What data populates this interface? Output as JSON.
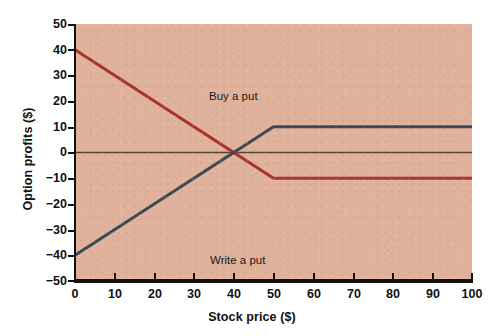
{
  "chart_data": {
    "type": "line",
    "title": "",
    "xlabel": "Stock price ($)",
    "ylabel": "Option profits ($)",
    "xlim": [
      0,
      100
    ],
    "ylim": [
      -50,
      50
    ],
    "xticks": [
      0,
      10,
      20,
      30,
      40,
      50,
      60,
      70,
      80,
      90,
      100
    ],
    "yticks": [
      50,
      40,
      30,
      20,
      10,
      0,
      -10,
      -20,
      -30,
      -40,
      -50
    ],
    "xtick_labels": [
      "0",
      "10",
      "20",
      "30",
      "40",
      "50",
      "60",
      "70",
      "80",
      "90",
      "100"
    ],
    "ytick_labels": [
      "50",
      "40",
      "30",
      "20",
      "10",
      "0",
      "−10",
      "−20",
      "−30",
      "−40",
      "−50"
    ],
    "grid": false,
    "legend": "inline-annotations",
    "zero_line": 0,
    "series": [
      {
        "name": "Buy a put",
        "color": "#a8332a",
        "points": [
          [
            0,
            40
          ],
          [
            50,
            -10
          ],
          [
            100,
            -10
          ]
        ],
        "x": [
          0,
          50,
          100
        ],
        "values": [
          40,
          -10,
          -10
        ]
      },
      {
        "name": "Write a put",
        "color": "#3c4a55",
        "points": [
          [
            0,
            -40
          ],
          [
            50,
            10
          ],
          [
            100,
            10
          ]
        ],
        "x": [
          0,
          50,
          100
        ],
        "values": [
          -40,
          10,
          10
        ]
      }
    ],
    "annotations": [
      {
        "text": "Buy a put",
        "x": 15,
        "y": 31
      },
      {
        "text": "Write a put",
        "x": 15,
        "y": -31
      }
    ],
    "plot_background": "#e0b29c",
    "figure_background": "#ffffff",
    "axis_color": "#111111"
  }
}
